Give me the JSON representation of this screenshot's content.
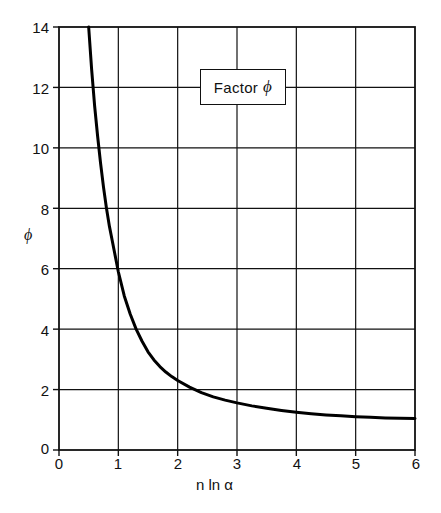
{
  "chart_data": {
    "type": "line",
    "title": "",
    "legend_label": "Factor",
    "legend_symbol": "ϕ",
    "legend_position": "inside-top-center",
    "xlabel": "n ln α",
    "ylabel": "ϕ",
    "xlim": [
      0,
      6
    ],
    "ylim": [
      0,
      14
    ],
    "xticks": [
      "0",
      "1",
      "2",
      "3",
      "4",
      "5",
      "6"
    ],
    "xtick_values": [
      0,
      1,
      2,
      3,
      4,
      5,
      6
    ],
    "yticks": [
      "0",
      "2",
      "4",
      "6",
      "8",
      "10",
      "12",
      "14"
    ],
    "ytick_values": [
      0,
      2,
      4,
      6,
      8,
      10,
      12,
      14
    ],
    "grid": true,
    "grid_color": "#111111",
    "line_color": "#000000",
    "line_width": 3,
    "series": [
      {
        "name": "Factor ϕ",
        "x": [
          0.45,
          0.5,
          0.55,
          0.6,
          0.65,
          0.7,
          0.75,
          0.8,
          0.85,
          0.9,
          0.95,
          1.0,
          1.1,
          1.2,
          1.3,
          1.4,
          1.5,
          1.6,
          1.7,
          1.8,
          1.9,
          2.0,
          2.2,
          2.4,
          2.6,
          2.8,
          3.0,
          3.25,
          3.5,
          3.75,
          4.0,
          4.25,
          4.5,
          4.75,
          5.0,
          5.25,
          5.5,
          5.75,
          6.0
        ],
        "y": [
          15.9,
          14.0,
          12.6,
          11.4,
          10.4,
          9.5,
          8.7,
          8.0,
          7.4,
          6.9,
          6.4,
          5.9,
          5.1,
          4.5,
          4.0,
          3.6,
          3.25,
          2.98,
          2.76,
          2.58,
          2.43,
          2.3,
          2.08,
          1.9,
          1.76,
          1.65,
          1.56,
          1.46,
          1.38,
          1.31,
          1.25,
          1.2,
          1.16,
          1.13,
          1.1,
          1.08,
          1.06,
          1.05,
          1.04
        ],
        "description": "Monotonically decreasing hyperbolic curve asymptotic to 1"
      }
    ],
    "notable_points": [
      {
        "x": 1,
        "y": 4.1,
        "note": "curve crosses near phi = 4 just right of n ln alpha = 1"
      },
      {
        "x": 2,
        "y": 2.0,
        "note": "curve crosses phi = 2 at n ln alpha = 2"
      },
      {
        "x": 6,
        "y": 1.0,
        "note": "asymptote approached at phi = 1"
      }
    ]
  },
  "axes": {
    "y_axis_label": "ϕ",
    "x_axis_label": "n ln α"
  },
  "legend": {
    "label": "Factor",
    "symbol": "ϕ",
    "full_text": "Factor ϕ"
  }
}
